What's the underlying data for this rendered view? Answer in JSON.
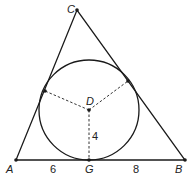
{
  "diagram": {
    "type": "triangle-with-incircle",
    "points": {
      "A": {
        "label": "A",
        "x": 16,
        "y": 160
      },
      "B": {
        "label": "B",
        "x": 185,
        "y": 160
      },
      "C": {
        "label": "C",
        "x": 77,
        "y": 10
      },
      "D": {
        "label": "D",
        "x": 89,
        "y": 110
      },
      "G": {
        "label": "G",
        "x": 89,
        "y": 160
      }
    },
    "tangent_points": [
      {
        "x": 45,
        "y": 91
      },
      {
        "x": 128,
        "y": 81
      }
    ],
    "circle": {
      "cx": 89,
      "cy": 110,
      "r": 50
    },
    "measurements": {
      "AG": "6",
      "GB": "8",
      "DG": "4"
    },
    "colors": {
      "stroke": "#1a1a1a",
      "background": "#ffffff"
    }
  }
}
